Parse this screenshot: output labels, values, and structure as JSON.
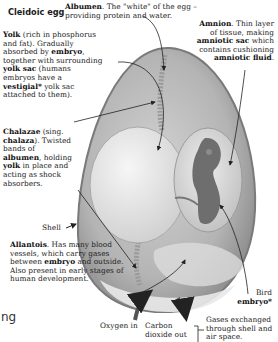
{
  "title": "Cleidoic egg",
  "labels": {
    "albumen": {
      "term": "Albumen",
      "text": ". The \"white\" of the egg – providing protein and water."
    },
    "yolk": {
      "term": "Yolk",
      "text1": " (rich in phosphorus and fat). Gradually absorbed by ",
      "embryo": "embryo",
      "text2": ", together with surrounding ",
      "yolk_sac": "yolk sac",
      "text3": " (humans embryos have a ",
      "vestigial": "vestigial*",
      "text4": " yolk sac attached to them)."
    },
    "amnion": {
      "term": "Amnion",
      "text1": ". Thin layer of tissue, making ",
      "sac": "amniotic sac",
      "text2": " which contains cushioning ",
      "fluid": "amniotic fluid",
      "end": "."
    },
    "chalazae": {
      "term": "Chalazae",
      "text1": " (sing. ",
      "sing": "chalaza",
      "text2": "). Twisted bands of ",
      "albumen": "albumen",
      "text3": ", holding ",
      "yolk": "yolk",
      "text4": " in place and acting as shock absorbers."
    },
    "shell": "Shell",
    "allantois": {
      "term": "Allantois",
      "text1": ". Has many blood vessels, which carry gases between ",
      "embryo": "embryo",
      "text2": " and outside. Also present in early stages of human development."
    },
    "bird_embryo": {
      "text": "Bird",
      "term": "embryo*"
    },
    "oxygen_in": "Oxygen in",
    "co2_out": "Carbon dioxide out",
    "gases": "Gases exchanged through shell and air space."
  },
  "fragment": "ng",
  "colors": {
    "shell": "#8a8a8a",
    "albumen": "#b9b9b9",
    "yolk": "#e0e0e0",
    "embryo": "#6a6a6a",
    "arrow": "#222222"
  }
}
